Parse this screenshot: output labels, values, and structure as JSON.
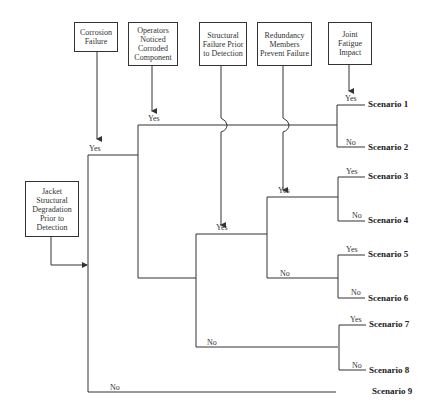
{
  "diagram": {
    "type": "event-tree",
    "initiating_event": "Jacket Structural Degradation Prior to Detection",
    "headers": [
      {
        "id": "h1",
        "label": "Corrosion Failure"
      },
      {
        "id": "h2",
        "label": "Operators Noticed Corroded Component"
      },
      {
        "id": "h3",
        "label": "Structural Failure Prior to Detection"
      },
      {
        "id": "h4",
        "label": "Redundancy Members Prevent Failure"
      },
      {
        "id": "h5",
        "label": "Joint Fatigue Impact"
      }
    ],
    "branch_labels": {
      "yes": "Yes",
      "no": "No"
    },
    "scenarios": [
      {
        "id": "s1",
        "label": "Scenario 1"
      },
      {
        "id": "s2",
        "label": "Scenario 2"
      },
      {
        "id": "s3",
        "label": "Scenario 3"
      },
      {
        "id": "s4",
        "label": "Scenario 4"
      },
      {
        "id": "s5",
        "label": "Scenario 5"
      },
      {
        "id": "s6",
        "label": "Scenario 6"
      },
      {
        "id": "s7",
        "label": "Scenario 7"
      },
      {
        "id": "s8",
        "label": "Scenario 8"
      },
      {
        "id": "s9",
        "label": "Scenario 9"
      }
    ],
    "paths": [
      {
        "scenario": "Scenario 1",
        "sequence": [
          "Corrosion Failure: Yes",
          "Operators Noticed: Yes",
          "Joint Fatigue Impact: Yes"
        ]
      },
      {
        "scenario": "Scenario 2",
        "sequence": [
          "Corrosion Failure: Yes",
          "Operators Noticed: Yes",
          "Joint Fatigue Impact: No"
        ]
      },
      {
        "scenario": "Scenario 3",
        "sequence": [
          "Corrosion Failure: Yes",
          "Operators Noticed: No",
          "Structural Failure: Yes",
          "Redundancy: Yes",
          "Joint Fatigue Impact: Yes"
        ]
      },
      {
        "scenario": "Scenario 4",
        "sequence": [
          "Corrosion Failure: Yes",
          "Operators Noticed: No",
          "Structural Failure: Yes",
          "Redundancy: Yes",
          "Joint Fatigue Impact: No"
        ]
      },
      {
        "scenario": "Scenario 5",
        "sequence": [
          "Corrosion Failure: Yes",
          "Operators Noticed: No",
          "Structural Failure: Yes",
          "Redundancy: No",
          "Joint Fatigue Impact: Yes"
        ]
      },
      {
        "scenario": "Scenario 6",
        "sequence": [
          "Corrosion Failure: Yes",
          "Operators Noticed: No",
          "Structural Failure: Yes",
          "Redundancy: No",
          "Joint Fatigue Impact: No"
        ]
      },
      {
        "scenario": "Scenario 7",
        "sequence": [
          "Corrosion Failure: Yes",
          "Operators Noticed: No",
          "Structural Failure: No",
          "Joint Fatigue Impact: Yes"
        ]
      },
      {
        "scenario": "Scenario 8",
        "sequence": [
          "Corrosion Failure: Yes",
          "Operators Noticed: No",
          "Structural Failure: No",
          "Joint Fatigue Impact: No"
        ]
      },
      {
        "scenario": "Scenario 9",
        "sequence": [
          "Corrosion Failure: No"
        ]
      }
    ],
    "colors": {
      "line": "#333333",
      "background": "#ffffff",
      "text": "#222222"
    }
  }
}
